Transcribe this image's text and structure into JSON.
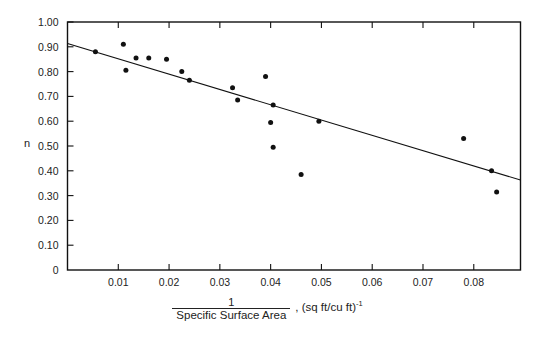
{
  "chart_data": {
    "type": "scatter",
    "title": "",
    "xlabel_numerator": "1",
    "xlabel_denominator": "Specific Surface Area",
    "xlabel_units": ", (sq ft/cu ft)",
    "xlabel_units_exponent": "-1",
    "ylabel": "n",
    "xlim": [
      0,
      0.0892
    ],
    "ylim": [
      0,
      1.0
    ],
    "grid": false,
    "legend": "none",
    "xticks": [
      0.01,
      0.02,
      0.03,
      0.04,
      0.05,
      0.06,
      0.07,
      0.08
    ],
    "xticklabels": [
      "0.01",
      "0.02",
      "0.03",
      "0.04",
      "0.05",
      "0.06",
      "0.07",
      "0.08"
    ],
    "yticks": [
      0,
      0.1,
      0.2,
      0.3,
      0.4,
      0.5,
      0.6,
      0.7,
      0.8,
      0.9,
      1.0
    ],
    "yticklabels": [
      "0",
      "0.10",
      "0.20",
      "0.30",
      "0.40",
      "0.50",
      "0.60",
      "0.70",
      "0.80",
      "0.90",
      "1.00"
    ],
    "x": [
      0.0055,
      0.011,
      0.0115,
      0.0135,
      0.016,
      0.0195,
      0.0225,
      0.024,
      0.0325,
      0.0335,
      0.039,
      0.0405,
      0.04,
      0.0405,
      0.046,
      0.0495,
      0.078,
      0.0835,
      0.0845
    ],
    "y": [
      0.88,
      0.91,
      0.805,
      0.855,
      0.855,
      0.85,
      0.8,
      0.765,
      0.735,
      0.685,
      0.78,
      0.665,
      0.595,
      0.495,
      0.385,
      0.6,
      0.53,
      0.4,
      0.315
    ],
    "marker": "filled-circle",
    "marker_color": "#111111",
    "marker_size_px": 5,
    "fit_line": {
      "x": [
        0.0,
        0.0892
      ],
      "y": [
        0.913,
        0.363
      ],
      "color": "#111111",
      "width_px": 1.1
    },
    "axis_color": "#111111"
  }
}
